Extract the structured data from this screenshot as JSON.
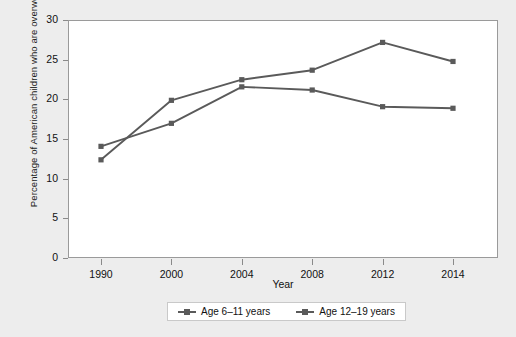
{
  "chart_data": {
    "type": "line",
    "title": "",
    "xlabel": "Year",
    "ylabel": "Percentage of American children who are overweight",
    "categories": [
      "1990",
      "2000",
      "2004",
      "2008",
      "2012",
      "2014"
    ],
    "x": [
      1990,
      2000,
      2004,
      2008,
      2012,
      2014
    ],
    "xlim": [
      0,
      5
    ],
    "ylim": [
      0,
      30
    ],
    "yticks": [
      0,
      5,
      10,
      15,
      20,
      25,
      30
    ],
    "ytick_labels": [
      "0",
      "5",
      "10",
      "15",
      "20",
      "25",
      "30"
    ],
    "xtick_labels": [
      "1990",
      "2000",
      "2004",
      "2008",
      "2012",
      "2014"
    ],
    "grid": false,
    "legend_position": "bottom",
    "axis_spacing": "categorical-even",
    "series": [
      {
        "name": "Age 6–11 years",
        "color": "#5a5a5a",
        "marker": "square",
        "values": [
          12.5,
          20.0,
          22.6,
          23.8,
          27.3,
          24.9
        ]
      },
      {
        "name": "Age 12–19 years",
        "color": "#5a5a5a",
        "marker": "square",
        "values": [
          14.2,
          17.1,
          21.7,
          21.3,
          19.2,
          19.0
        ]
      }
    ]
  },
  "axes": {
    "x_title": "Year",
    "y_title": "Percentage of American children who are overweight"
  },
  "legend": {
    "entries": [
      {
        "label": "Age 6–11 years"
      },
      {
        "label": "Age 12–19 years"
      }
    ]
  },
  "colors": {
    "background": "#ededed",
    "plot_background": "#ffffff",
    "line": "#5a5a5a",
    "axis": "#8a8a8a",
    "text": "#111111"
  }
}
